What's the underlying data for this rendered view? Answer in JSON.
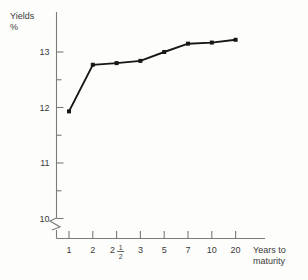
{
  "axes": {
    "y_title": "Yields",
    "y_unit": "%",
    "x_title_line1": "Years to",
    "x_title_line2": "maturity"
  },
  "chart_data": {
    "type": "line",
    "title": "",
    "xlabel": "Years to maturity",
    "ylabel": "Yields %",
    "categories": [
      "1",
      "2",
      "2 1/2",
      "3",
      "5",
      "7",
      "10",
      "20"
    ],
    "values": [
      11.93,
      12.77,
      12.8,
      12.84,
      13.0,
      13.15,
      13.17,
      13.22
    ],
    "ylim": [
      9.6,
      13.5
    ],
    "y_ticks_major": [
      10,
      11,
      12,
      13
    ],
    "y_ticks_minor": [
      10.5,
      11.5,
      12.5
    ],
    "y_tick_labels": [
      "10",
      "11",
      "12",
      "13"
    ],
    "x_tick_labels": [
      "1",
      "2",
      "2½",
      "3",
      "5",
      "7",
      "10",
      "20"
    ],
    "grid": false,
    "legend": null,
    "axis_break": "y-axis below 10",
    "marker": "square",
    "line_color": "#171717",
    "axis_color": "#7b7b7b",
    "background_color": "#fdfdfb"
  }
}
